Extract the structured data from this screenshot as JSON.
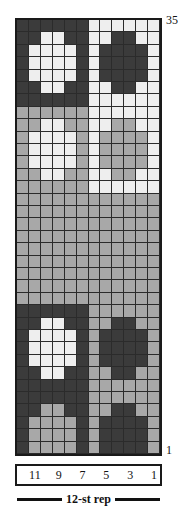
{
  "figure": {
    "kind": "knitting-colorwork-chart",
    "row_count": 35,
    "column_count": 12
  },
  "row_labels": {
    "top": "35",
    "bottom": "1"
  },
  "column_labels": [
    "",
    "11",
    "",
    "9",
    "",
    "7",
    "",
    "5",
    "",
    "3",
    "",
    "1"
  ],
  "repeat": {
    "label": "12-st rep"
  },
  "colors": {
    "dark": "#3b3b3b",
    "medium": "#a8a8a8",
    "light": "#eeeeee",
    "border": "#1a1a1a",
    "gridline": "#2b2b2b",
    "text": "#121212",
    "background": "#ffffff"
  },
  "chart_data": {
    "type": "heatmap",
    "title": "",
    "xlabel": "12-st rep",
    "ylabel": "",
    "grid": true,
    "legend": "none",
    "x": [
      "12",
      "11",
      "10",
      "9",
      "8",
      "7",
      "6",
      "5",
      "4",
      "3",
      "2",
      "1"
    ],
    "xtick_labels": [
      "",
      "11",
      "",
      "9",
      "",
      "7",
      "",
      "5",
      "",
      "3",
      "",
      "1"
    ],
    "y_top": 35,
    "y_bottom": 1,
    "value_levels": [
      "d",
      "m",
      "l"
    ],
    "level_colors": {
      "d": "#3b3b3b",
      "m": "#a8a8a8",
      "l": "#eeeeee"
    },
    "rows": [
      {
        "row": 35,
        "cells": [
          "d",
          "d",
          "d",
          "d",
          "d",
          "d",
          "l",
          "l",
          "l",
          "l",
          "l",
          "l"
        ]
      },
      {
        "row": 34,
        "cells": [
          "d",
          "d",
          "l",
          "l",
          "d",
          "d",
          "l",
          "l",
          "d",
          "d",
          "l",
          "l"
        ]
      },
      {
        "row": 33,
        "cells": [
          "d",
          "l",
          "l",
          "l",
          "l",
          "d",
          "l",
          "d",
          "d",
          "d",
          "d",
          "l"
        ]
      },
      {
        "row": 32,
        "cells": [
          "d",
          "l",
          "l",
          "l",
          "l",
          "d",
          "l",
          "d",
          "d",
          "d",
          "d",
          "l"
        ]
      },
      {
        "row": 31,
        "cells": [
          "d",
          "l",
          "l",
          "l",
          "l",
          "d",
          "l",
          "d",
          "d",
          "d",
          "d",
          "l"
        ]
      },
      {
        "row": 30,
        "cells": [
          "d",
          "d",
          "l",
          "l",
          "d",
          "d",
          "l",
          "l",
          "d",
          "d",
          "l",
          "l"
        ]
      },
      {
        "row": 29,
        "cells": [
          "d",
          "d",
          "d",
          "d",
          "d",
          "d",
          "l",
          "l",
          "l",
          "l",
          "l",
          "l"
        ]
      },
      {
        "row": 28,
        "cells": [
          "m",
          "m",
          "m",
          "m",
          "m",
          "m",
          "l",
          "l",
          "l",
          "l",
          "l",
          "l"
        ]
      },
      {
        "row": 27,
        "cells": [
          "m",
          "m",
          "l",
          "l",
          "m",
          "m",
          "l",
          "l",
          "m",
          "m",
          "l",
          "l"
        ]
      },
      {
        "row": 26,
        "cells": [
          "m",
          "l",
          "l",
          "l",
          "l",
          "m",
          "l",
          "m",
          "m",
          "m",
          "m",
          "l"
        ]
      },
      {
        "row": 25,
        "cells": [
          "m",
          "l",
          "l",
          "l",
          "l",
          "m",
          "l",
          "m",
          "m",
          "m",
          "m",
          "l"
        ]
      },
      {
        "row": 24,
        "cells": [
          "m",
          "l",
          "l",
          "l",
          "l",
          "m",
          "l",
          "m",
          "m",
          "m",
          "m",
          "l"
        ]
      },
      {
        "row": 23,
        "cells": [
          "m",
          "m",
          "l",
          "l",
          "m",
          "m",
          "l",
          "l",
          "m",
          "m",
          "l",
          "l"
        ]
      },
      {
        "row": 22,
        "cells": [
          "m",
          "m",
          "m",
          "m",
          "m",
          "m",
          "l",
          "l",
          "l",
          "l",
          "l",
          "l"
        ]
      },
      {
        "row": 21,
        "cells": [
          "m",
          "m",
          "m",
          "m",
          "m",
          "m",
          "m",
          "m",
          "m",
          "m",
          "m",
          "m"
        ]
      },
      {
        "row": 20,
        "cells": [
          "m",
          "m",
          "m",
          "m",
          "m",
          "m",
          "m",
          "m",
          "m",
          "m",
          "m",
          "m"
        ]
      },
      {
        "row": 19,
        "cells": [
          "m",
          "m",
          "m",
          "m",
          "m",
          "m",
          "m",
          "m",
          "m",
          "m",
          "m",
          "m"
        ]
      },
      {
        "row": 18,
        "cells": [
          "m",
          "m",
          "m",
          "m",
          "m",
          "m",
          "m",
          "m",
          "m",
          "m",
          "m",
          "m"
        ]
      },
      {
        "row": 17,
        "cells": [
          "m",
          "m",
          "m",
          "m",
          "m",
          "m",
          "m",
          "m",
          "m",
          "m",
          "m",
          "m"
        ]
      },
      {
        "row": 16,
        "cells": [
          "m",
          "m",
          "m",
          "m",
          "m",
          "m",
          "m",
          "m",
          "m",
          "m",
          "m",
          "m"
        ]
      },
      {
        "row": 15,
        "cells": [
          "m",
          "m",
          "m",
          "m",
          "m",
          "m",
          "m",
          "m",
          "m",
          "m",
          "m",
          "m"
        ]
      },
      {
        "row": 14,
        "cells": [
          "m",
          "m",
          "m",
          "m",
          "m",
          "m",
          "m",
          "m",
          "m",
          "m",
          "m",
          "m"
        ]
      },
      {
        "row": 13,
        "cells": [
          "m",
          "m",
          "m",
          "m",
          "m",
          "m",
          "m",
          "m",
          "m",
          "m",
          "m",
          "m"
        ]
      },
      {
        "row": 12,
        "cells": [
          "d",
          "d",
          "d",
          "d",
          "d",
          "d",
          "m",
          "m",
          "m",
          "m",
          "m",
          "m"
        ]
      },
      {
        "row": 11,
        "cells": [
          "d",
          "d",
          "l",
          "l",
          "d",
          "d",
          "m",
          "m",
          "d",
          "d",
          "m",
          "m"
        ]
      },
      {
        "row": 10,
        "cells": [
          "d",
          "l",
          "l",
          "l",
          "l",
          "d",
          "m",
          "d",
          "d",
          "d",
          "d",
          "m"
        ]
      },
      {
        "row": 9,
        "cells": [
          "d",
          "l",
          "l",
          "l",
          "l",
          "d",
          "m",
          "d",
          "d",
          "d",
          "d",
          "m"
        ]
      },
      {
        "row": 8,
        "cells": [
          "d",
          "l",
          "l",
          "l",
          "l",
          "d",
          "m",
          "d",
          "d",
          "d",
          "d",
          "m"
        ]
      },
      {
        "row": 7,
        "cells": [
          "d",
          "d",
          "l",
          "l",
          "d",
          "d",
          "m",
          "m",
          "d",
          "d",
          "m",
          "m"
        ]
      },
      {
        "row": 6,
        "cells": [
          "d",
          "d",
          "d",
          "d",
          "d",
          "d",
          "m",
          "m",
          "m",
          "m",
          "m",
          "m"
        ]
      },
      {
        "row": 5,
        "cells": [
          "d",
          "d",
          "d",
          "d",
          "d",
          "d",
          "m",
          "m",
          "m",
          "m",
          "m",
          "m"
        ]
      },
      {
        "row": 4,
        "cells": [
          "d",
          "d",
          "m",
          "m",
          "d",
          "d",
          "m",
          "m",
          "d",
          "d",
          "m",
          "m"
        ]
      },
      {
        "row": 3,
        "cells": [
          "d",
          "m",
          "m",
          "m",
          "m",
          "d",
          "m",
          "d",
          "d",
          "d",
          "d",
          "m"
        ]
      },
      {
        "row": 2,
        "cells": [
          "d",
          "m",
          "m",
          "m",
          "m",
          "d",
          "m",
          "d",
          "d",
          "d",
          "d",
          "m"
        ]
      },
      {
        "row": 1,
        "cells": [
          "d",
          "m",
          "m",
          "m",
          "m",
          "d",
          "m",
          "d",
          "d",
          "d",
          "d",
          "m"
        ]
      }
    ]
  }
}
